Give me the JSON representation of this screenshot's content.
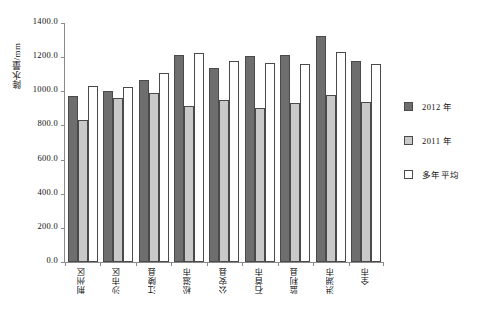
{
  "chart_data": {
    "type": "bar",
    "title": "",
    "xlabel": "",
    "ylabel": "降水量/mm",
    "ylim": [
      0,
      1400
    ],
    "ytick_step": 200,
    "ytick_labels": [
      "1400.0",
      "1200.0",
      "1000.0",
      "800.0",
      "600.0",
      "400.0",
      "200.0",
      "0.0"
    ],
    "ytick_values": [
      1400,
      1200,
      1000,
      800,
      600,
      400,
      200,
      0
    ],
    "grid": false,
    "legend_position": "right",
    "categories": [
      "荆州区",
      "沙市区",
      "江陵县",
      "松滋市",
      "公安县",
      "石首市",
      "监利县",
      "洪湖市",
      "全市"
    ],
    "series": [
      {
        "name": "2012 年",
        "color": "#6e6e6e",
        "values": [
          975,
          1000,
          1065,
          1215,
          1135,
          1205,
          1210,
          1325,
          1180
        ]
      },
      {
        "name": "2011 年",
        "color": "#c9c9c9",
        "values": [
          830,
          960,
          990,
          915,
          950,
          905,
          930,
          980,
          935
        ]
      },
      {
        "name": "多年平均",
        "color": "#ffffff",
        "values": [
          1030,
          1025,
          1105,
          1225,
          1180,
          1165,
          1160,
          1230,
          1160
        ]
      }
    ]
  },
  "legend": {
    "items": [
      {
        "label": "2012 年"
      },
      {
        "label": "2011 年"
      },
      {
        "label": "多年平均"
      }
    ]
  }
}
